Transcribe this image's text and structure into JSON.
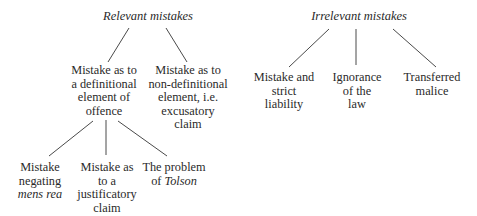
{
  "diagram": {
    "relevant": {
      "title": "Relevant mistakes",
      "definitional": {
        "lines": [
          "Mistake as to",
          "a definitional",
          "element of",
          "offence"
        ],
        "children": {
          "mens_rea": {
            "lines": [
              "Mistake",
              "negating"
            ],
            "italic_line": "mens rea"
          },
          "justificatory": {
            "lines": [
              "Mistake as",
              "to a",
              "justificatory",
              "claim"
            ]
          },
          "tolson": {
            "line1": "The problem",
            "prefix": "of ",
            "italic": "Tolson"
          }
        }
      },
      "non_definitional": {
        "lines": [
          "Mistake as to",
          "non-definitional",
          "element, i.e.",
          "excusatory",
          "claim"
        ]
      }
    },
    "irrelevant": {
      "title": "Irrelevant mistakes",
      "strict_liability": {
        "lines": [
          "Mistake and",
          "strict",
          "liability"
        ]
      },
      "ignorance": {
        "lines": [
          "Ignorance",
          "of the",
          "law"
        ]
      },
      "transferred": {
        "lines": [
          "Transferred",
          "malice"
        ]
      }
    }
  }
}
